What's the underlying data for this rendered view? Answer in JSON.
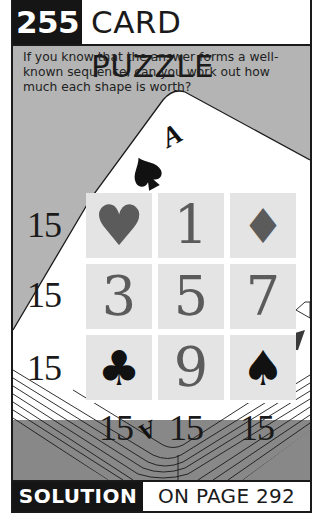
{
  "header": {
    "puzzle_number": "255",
    "title": "CARD PUZZLE"
  },
  "intro": {
    "text": "If you know that the answer forms a well-known sequence, can you work out how much each shape is worth?"
  },
  "card": {
    "rank_top": "A",
    "rank_bottom": "A",
    "suit_icon": "spade-icon"
  },
  "grid": {
    "cells": [
      {
        "type": "symbol",
        "value": "♥",
        "icon": "heart-icon",
        "color": "#5b5b5b"
      },
      {
        "type": "number",
        "value": "1"
      },
      {
        "type": "symbol",
        "value": "♦",
        "icon": "diamond-icon",
        "color": "#5b5b5b"
      },
      {
        "type": "number",
        "value": "3"
      },
      {
        "type": "number",
        "value": "5"
      },
      {
        "type": "number",
        "value": "7"
      },
      {
        "type": "symbol",
        "value": "♣",
        "icon": "club-icon",
        "color": "#111111"
      },
      {
        "type": "number",
        "value": "9"
      },
      {
        "type": "symbol",
        "value": "♠",
        "icon": "spade-icon",
        "color": "#111111"
      }
    ],
    "row_sums": [
      "15",
      "15",
      "15"
    ],
    "column_sums": [
      "15",
      "15",
      "15"
    ]
  },
  "footer": {
    "solution_label": "SOLUTION",
    "page_ref": "ON PAGE 292"
  },
  "colors": {
    "frame": "#1a1a1a",
    "header_badge_bg": "#151515",
    "upper_background": "#b4b4b4",
    "lower_background": "#888888",
    "cell_bg": "#e4e4e4",
    "red_suit_gray": "#5b5b5b"
  }
}
